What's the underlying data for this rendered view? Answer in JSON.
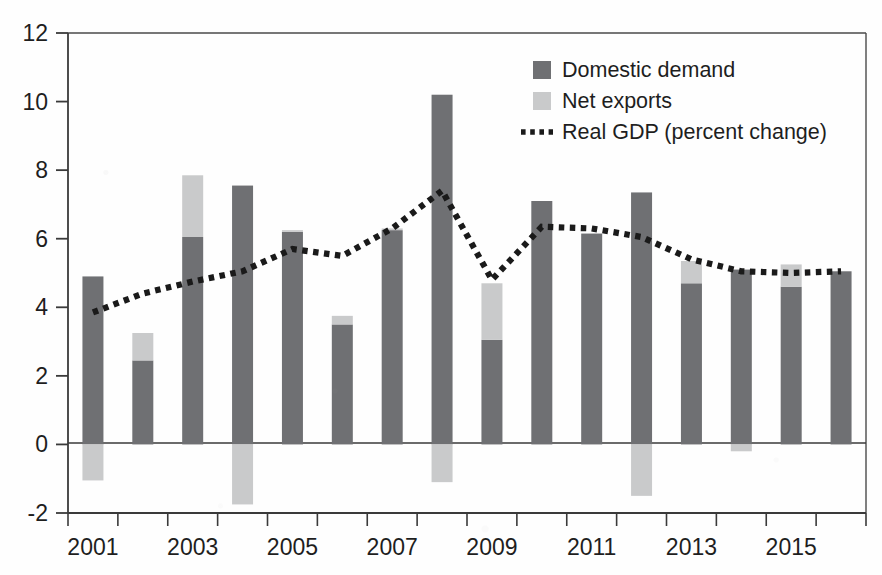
{
  "chart_data": {
    "type": "bar",
    "title": "",
    "subtitle": "",
    "xlabel": "",
    "ylabel": "",
    "grid": false,
    "stacked": true,
    "legend_position": "top-right",
    "x": [
      2001,
      2002,
      2003,
      2004,
      2005,
      2006,
      2007,
      2008,
      2009,
      2010,
      2011,
      2012,
      2013,
      2014,
      2015,
      2016
    ],
    "categories": [
      "2001",
      "2002",
      "2003",
      "2004",
      "2005",
      "2006",
      "2007",
      "2008",
      "2009",
      "2010",
      "2011",
      "2012",
      "2013",
      "2014",
      "2015",
      "2016"
    ],
    "xtick_labels": [
      "2001",
      "2003",
      "2005",
      "2007",
      "2009",
      "2011",
      "2013",
      "2015"
    ],
    "xtick_values": [
      2001,
      2003,
      2005,
      2007,
      2009,
      2011,
      2013,
      2015
    ],
    "ytick_labels": [
      "-2",
      "0",
      "2",
      "4",
      "6",
      "8",
      "10",
      "12"
    ],
    "ytick_values": [
      -2,
      0,
      2,
      4,
      6,
      8,
      10,
      12
    ],
    "ylim": [
      -2,
      12
    ],
    "xlim": [
      2000.5,
      2016.5
    ],
    "zero_line": 0,
    "series": [
      {
        "name": "Domestic demand",
        "kind": "bar-segment",
        "color": "#6f7073",
        "values": [
          4.9,
          2.45,
          6.05,
          7.55,
          6.2,
          3.5,
          6.25,
          10.2,
          3.05,
          7.1,
          6.15,
          7.35,
          4.7,
          5.1,
          4.6,
          5.05
        ]
      },
      {
        "name": "Net exports",
        "kind": "bar-segment",
        "color": "#c9cacb",
        "values": [
          -1.05,
          0.8,
          1.8,
          -1.75,
          0.05,
          0.25,
          0.05,
          -1.1,
          1.65,
          0.0,
          0.0,
          -1.5,
          0.65,
          -0.2,
          0.65,
          0.0
        ]
      },
      {
        "name": "Real GDP (percent change)",
        "kind": "dotted-line",
        "color": "#1a1a1a",
        "values": [
          3.85,
          4.4,
          4.75,
          5.05,
          5.7,
          5.5,
          6.3,
          7.4,
          4.8,
          6.35,
          6.3,
          6.05,
          5.4,
          5.05,
          5.0,
          5.05
        ]
      }
    ],
    "legend": [
      {
        "label": "Domestic demand",
        "marker": "square",
        "color": "#6f7073"
      },
      {
        "label": "Net exports",
        "marker": "square",
        "color": "#c9cacb"
      },
      {
        "label": "Real GDP (percent change)",
        "marker": "dotted-line",
        "color": "#1a1a1a"
      }
    ],
    "colors": {
      "domestic_demand": "#6f7073",
      "net_exports": "#c9cacb",
      "real_gdp_line": "#1a1a1a",
      "axis": "#3a3a3a",
      "background": "#fefefe"
    }
  }
}
